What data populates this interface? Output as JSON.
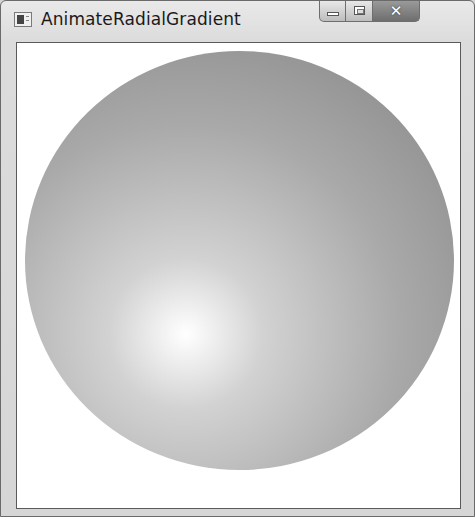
{
  "window": {
    "title": "AnimateRadialGradient",
    "icon": "app-window-icon",
    "controls": {
      "minimize": {
        "icon": "minimize-icon",
        "label": ""
      },
      "maximize": {
        "icon": "maximize-icon",
        "label": ""
      },
      "close": {
        "icon": "close-icon",
        "label": "✕"
      }
    }
  },
  "content": {
    "shape": "ellipse",
    "fill": {
      "type": "radial-gradient",
      "center_color": "#ffffff",
      "edge_color": "#858585",
      "gradient_origin": [
        0.375,
        0.675
      ]
    },
    "background": "#ffffff"
  }
}
